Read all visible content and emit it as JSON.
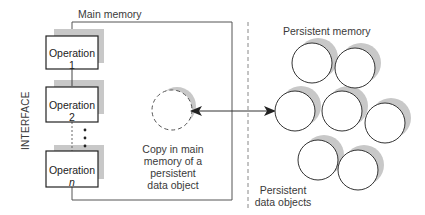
{
  "diagram": {
    "title_main_memory": "Main memory",
    "title_persistent_memory": "Persistent memory",
    "interface_label": "INTERFACE",
    "operations": [
      {
        "label": "Operation 1",
        "italic_suffix": ""
      },
      {
        "label": "Operation 2",
        "italic_suffix": ""
      },
      {
        "label": "Operation ",
        "italic_suffix": "n"
      }
    ],
    "ellipsis": "⋮",
    "copy_caption": [
      "Copy in main",
      "memory of a",
      "persistent",
      "data object"
    ],
    "persistent_objects_caption": [
      "Persistent",
      "data objects"
    ],
    "persistent_object_count": 7,
    "colors": {
      "stroke": "#333333",
      "shadow": "#c8c8c8",
      "text": "#3a3a3a",
      "divider": "#888888"
    }
  }
}
